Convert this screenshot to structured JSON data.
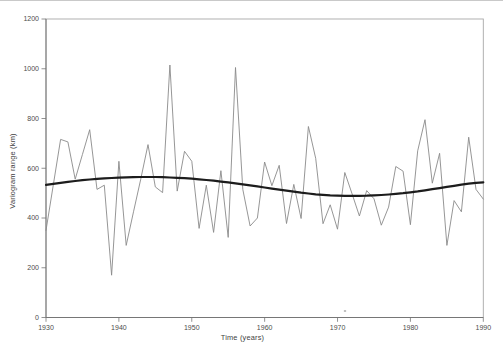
{
  "figure": {
    "background_color": "#ffffff",
    "frame_color": "#a8a8a8",
    "axis_color": "#767676",
    "text_color": "#4c4c4c"
  },
  "chart_data": {
    "type": "line",
    "title": "",
    "xlabel": "Time (years)",
    "ylabel": "Variogram range (km)",
    "xlim": [
      1930,
      1990
    ],
    "ylim": [
      0,
      1200
    ],
    "x_ticks": [
      1930,
      1940,
      1950,
      1960,
      1970,
      1980,
      1990
    ],
    "y_ticks": [
      0,
      200,
      400,
      600,
      800,
      1000,
      1200
    ],
    "grid": false,
    "legend": "none",
    "years": [
      1930,
      1931,
      1932,
      1933,
      1934,
      1935,
      1936,
      1937,
      1938,
      1939,
      1940,
      1941,
      1942,
      1943,
      1944,
      1945,
      1946,
      1947,
      1948,
      1949,
      1950,
      1951,
      1952,
      1953,
      1954,
      1955,
      1956,
      1957,
      1958,
      1959,
      1960,
      1961,
      1962,
      1963,
      1964,
      1965,
      1966,
      1967,
      1968,
      1969,
      1970,
      1971,
      1972,
      1973,
      1974,
      1975,
      1976,
      1977,
      1978,
      1979,
      1980,
      1981,
      1982,
      1983,
      1984,
      1985,
      1986,
      1987,
      1988,
      1989,
      1990
    ],
    "series": [
      {
        "id": "observed",
        "name": "Annual variogram range",
        "color": "#8a8a8a",
        "stroke_width": 0.9,
        "values": [
          350,
          533,
          716,
          706,
          556,
          655,
          755,
          515,
          532,
          170,
          628,
          290,
          425,
          555,
          695,
          525,
          502,
          1015,
          508,
          668,
          628,
          358,
          532,
          342,
          590,
          322,
          1005,
          515,
          368,
          400,
          625,
          530,
          612,
          378,
          535,
          398,
          768,
          640,
          377,
          453,
          355,
          583,
          497,
          408,
          510,
          477,
          371,
          444,
          607,
          588,
          373,
          670,
          795,
          540,
          660,
          290,
          470,
          425,
          725,
          515,
          476
        ]
      },
      {
        "id": "trend",
        "name": "Smoothed trend",
        "color": "#1c1c1c",
        "stroke_width": 2.2,
        "values": [
          533.0,
          537.5,
          541.6,
          545.4,
          548.9,
          552.0,
          554.8,
          557.2,
          559.3,
          561.0,
          562.3,
          563.3,
          564.1,
          564.7,
          565.0,
          564.8,
          564.1,
          563.0,
          561.6,
          559.9,
          557.9,
          555.5,
          552.8,
          549.8,
          546.5,
          543.0,
          539.2,
          535.2,
          531.1,
          526.9,
          522.6,
          518.3,
          514.0,
          509.8,
          505.7,
          501.8,
          498.3,
          495.3,
          492.8,
          490.9,
          489.6,
          488.9,
          488.8,
          489.1,
          489.8,
          490.9,
          492.4,
          494.3,
          496.8,
          499.8,
          503.2,
          507.0,
          511.2,
          515.6,
          520.2,
          524.9,
          529.6,
          534.1,
          538.2,
          541.2,
          543.0
        ]
      }
    ],
    "scan_artifact_dot": {
      "x": 345,
      "y": 310
    }
  }
}
